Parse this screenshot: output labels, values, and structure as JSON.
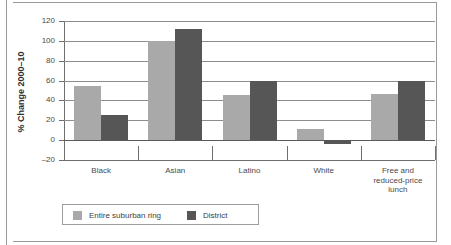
{
  "chart_data": {
    "type": "bar",
    "title": "",
    "xlabel": "",
    "ylabel": "% Change 2000–10",
    "ylim": [
      -20,
      120
    ],
    "yticks": [
      120,
      100,
      80,
      60,
      40,
      20,
      0,
      -20
    ],
    "ytick_labels": [
      "120",
      "100",
      "80",
      "60",
      "40",
      "20",
      "0",
      "–20"
    ],
    "grid": true,
    "legend_position": "bottom-left",
    "categories": [
      "Black",
      "Asian",
      "Latino",
      "White",
      "Free and\nreduced-price\nlunch"
    ],
    "series": [
      {
        "name": "Entire suburban ring",
        "color": "#a9a9a9",
        "values": [
          55,
          100,
          45,
          11,
          46
        ]
      },
      {
        "name": "District",
        "color": "#565656",
        "values": [
          25,
          112,
          60,
          -4,
          60
        ]
      }
    ]
  },
  "legend": {
    "items": [
      {
        "label": "Entire suburban ring",
        "swatch": "light"
      },
      {
        "label": "District",
        "swatch": "dark"
      }
    ]
  },
  "colors": {
    "series_light": "#a9a9a9",
    "series_dark": "#565656",
    "gridline": "#8d8d8d",
    "axis": "#6e6e6e",
    "frame": "#9a9a9a",
    "text": "#4a4a4a",
    "background": "#ffffff"
  }
}
